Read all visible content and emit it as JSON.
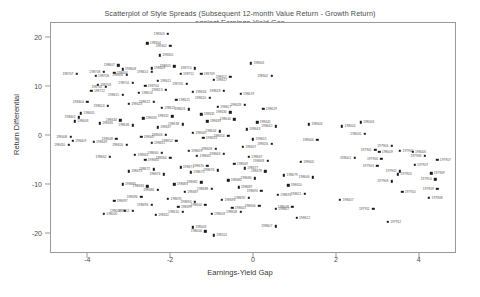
{
  "chart_data": {
    "type": "scatter",
    "title_line1": "Scatterplot of Style Spreads (Subsequent 12-month Value Return - Growth Return)",
    "title_line2": "against Earnings-Yield Gap",
    "xlabel": "Earnings-Yield Gap",
    "ylabel": "Return Differential",
    "xlim": [
      -4.9,
      4.9
    ],
    "ylim": [
      -24,
      23
    ],
    "xticks": [
      -4,
      -2,
      0,
      2,
      4
    ],
    "xtick_labels": [
      "-4",
      "-2",
      "0",
      "2",
      "4"
    ],
    "yticks": [
      20,
      10,
      0,
      -10,
      -20
    ],
    "ytick_labels": [
      "20",
      "10",
      "0",
      "-10",
      "-20"
    ],
    "grid": false,
    "legend": "none",
    "marker": "square",
    "marker_color": "#1a1a1a",
    "point_labels_shown": true,
    "points": [
      {
        "x": -2.05,
        "y": 20.6,
        "label": "198303"
      },
      {
        "x": -2.55,
        "y": 18.7,
        "label": "198304"
      },
      {
        "x": -2.0,
        "y": 18.2,
        "label": "198302"
      },
      {
        "x": -2.25,
        "y": 16.2,
        "label": "198305"
      },
      {
        "x": -3.25,
        "y": 14.2,
        "label": "198607"
      },
      {
        "x": -3.15,
        "y": 13.4,
        "label": "198608"
      },
      {
        "x": -3.6,
        "y": 12.9,
        "label": "198708"
      },
      {
        "x": -3.35,
        "y": 12.7,
        "label": "198604"
      },
      {
        "x": -3.05,
        "y": 12.3,
        "label": "198606"
      },
      {
        "x": -2.45,
        "y": 13.6,
        "label": "198609"
      },
      {
        "x": -2.45,
        "y": 12.9,
        "label": "198610"
      },
      {
        "x": -3.8,
        "y": 12.0,
        "label": "198706"
      },
      {
        "x": -1.9,
        "y": 14.0,
        "label": "198605"
      },
      {
        "x": -1.75,
        "y": 12.4,
        "label": "198711"
      },
      {
        "x": -1.4,
        "y": 13.6,
        "label": "198710"
      },
      {
        "x": -1.25,
        "y": 12.5,
        "label": "198709"
      },
      {
        "x": -0.55,
        "y": 11.8,
        "label": "198612"
      },
      {
        "x": -2.3,
        "y": 11.0,
        "label": "198611"
      },
      {
        "x": -2.9,
        "y": 10.6,
        "label": "198701"
      },
      {
        "x": -3.75,
        "y": 10.2,
        "label": "198703"
      },
      {
        "x": -3.55,
        "y": 9.8,
        "label": "198702"
      },
      {
        "x": -2.6,
        "y": 10.0,
        "label": "198704"
      },
      {
        "x": -1.6,
        "y": 10.4,
        "label": "198705"
      },
      {
        "x": -0.95,
        "y": 11.2,
        "label": "198617"
      },
      {
        "x": -2.1,
        "y": 9.2,
        "label": "198613"
      },
      {
        "x": -2.75,
        "y": 8.6,
        "label": "198614"
      },
      {
        "x": -3.15,
        "y": 8.2,
        "label": "198615"
      },
      {
        "x": -1.45,
        "y": 8.8,
        "label": "198616"
      },
      {
        "x": -0.7,
        "y": 9.0,
        "label": "198618"
      },
      {
        "x": -0.3,
        "y": 8.4,
        "label": "198619"
      },
      {
        "x": -1.05,
        "y": 7.6,
        "label": "198620"
      },
      {
        "x": -1.85,
        "y": 7.2,
        "label": "198621"
      },
      {
        "x": -2.4,
        "y": 6.8,
        "label": "198622"
      },
      {
        "x": -3.0,
        "y": 6.4,
        "label": "198623"
      },
      {
        "x": -3.5,
        "y": 6.0,
        "label": "198624"
      },
      {
        "x": -2.2,
        "y": 5.6,
        "label": "198625"
      },
      {
        "x": -1.55,
        "y": 5.2,
        "label": "198626"
      },
      {
        "x": -0.85,
        "y": 5.8,
        "label": "198627"
      },
      {
        "x": -0.2,
        "y": 6.2,
        "label": "198628"
      },
      {
        "x": 0.25,
        "y": 5.4,
        "label": "198629"
      },
      {
        "x": -0.55,
        "y": 4.6,
        "label": "198630"
      },
      {
        "x": -1.25,
        "y": 4.2,
        "label": "198631"
      },
      {
        "x": -1.95,
        "y": 3.8,
        "label": "198632"
      },
      {
        "x": -2.65,
        "y": 3.4,
        "label": "198633"
      },
      {
        "x": -3.2,
        "y": 3.0,
        "label": "198634"
      },
      {
        "x": -3.7,
        "y": 2.4,
        "label": "198635"
      },
      {
        "x": -2.9,
        "y": 2.0,
        "label": "198636"
      },
      {
        "x": -2.3,
        "y": 1.6,
        "label": "198637"
      },
      {
        "x": -1.7,
        "y": 2.2,
        "label": "198638"
      },
      {
        "x": -1.1,
        "y": 2.8,
        "label": "198639"
      },
      {
        "x": -0.45,
        "y": 3.2,
        "label": "198640"
      },
      {
        "x": 0.1,
        "y": 2.6,
        "label": "198641"
      },
      {
        "x": 0.55,
        "y": 1.8,
        "label": "198642"
      },
      {
        "x": -0.15,
        "y": 1.2,
        "label": "198643"
      },
      {
        "x": -0.8,
        "y": 0.8,
        "label": "198644"
      },
      {
        "x": -1.45,
        "y": 0.4,
        "label": "198645"
      },
      {
        "x": -2.1,
        "y": 0.0,
        "label": "198646"
      },
      {
        "x": -2.7,
        "y": -0.4,
        "label": "198647"
      },
      {
        "x": -3.3,
        "y": -0.8,
        "label": "198648"
      },
      {
        "x": -3.85,
        "y": -1.4,
        "label": "198649"
      },
      {
        "x": -3.05,
        "y": -2.0,
        "label": "198650"
      },
      {
        "x": -2.45,
        "y": -1.6,
        "label": "198651"
      },
      {
        "x": -1.85,
        "y": -1.2,
        "label": "198652"
      },
      {
        "x": -1.2,
        "y": -0.6,
        "label": "198653"
      },
      {
        "x": -0.6,
        "y": -0.2,
        "label": "198654"
      },
      {
        "x": 0.0,
        "y": -0.9,
        "label": "198655"
      },
      {
        "x": 0.45,
        "y": -1.8,
        "label": "198656"
      },
      {
        "x": -0.25,
        "y": -2.4,
        "label": "198657"
      },
      {
        "x": -0.9,
        "y": -2.8,
        "label": "198658"
      },
      {
        "x": -1.55,
        "y": -3.2,
        "label": "198659"
      },
      {
        "x": -2.2,
        "y": -3.6,
        "label": "198660"
      },
      {
        "x": -2.85,
        "y": -4.0,
        "label": "198661"
      },
      {
        "x": -3.45,
        "y": -4.4,
        "label": "198662"
      },
      {
        "x": -2.6,
        "y": -5.0,
        "label": "198663"
      },
      {
        "x": -2.0,
        "y": -4.6,
        "label": "198664"
      },
      {
        "x": -1.35,
        "y": -4.2,
        "label": "198665"
      },
      {
        "x": -0.7,
        "y": -3.8,
        "label": "198666"
      },
      {
        "x": -0.1,
        "y": -4.4,
        "label": "198667"
      },
      {
        "x": 0.35,
        "y": -5.2,
        "label": "198668"
      },
      {
        "x": -0.45,
        "y": -5.8,
        "label": "198669"
      },
      {
        "x": -1.1,
        "y": -6.2,
        "label": "198670"
      },
      {
        "x": -1.75,
        "y": -6.6,
        "label": "198671"
      },
      {
        "x": -2.4,
        "y": -7.0,
        "label": "198672"
      },
      {
        "x": -3.0,
        "y": -7.4,
        "label": "198673"
      },
      {
        "x": -2.15,
        "y": -8.0,
        "label": "198674"
      },
      {
        "x": -1.5,
        "y": -7.6,
        "label": "198675"
      },
      {
        "x": -0.85,
        "y": -7.2,
        "label": "198676"
      },
      {
        "x": -0.2,
        "y": -6.8,
        "label": "198677"
      },
      {
        "x": 0.3,
        "y": -7.4,
        "label": "198678"
      },
      {
        "x": 0.75,
        "y": -8.2,
        "label": "198679"
      },
      {
        "x": 0.05,
        "y": -8.8,
        "label": "198680"
      },
      {
        "x": -0.6,
        "y": -9.2,
        "label": "198681"
      },
      {
        "x": -1.25,
        "y": -9.6,
        "label": "198682"
      },
      {
        "x": -1.9,
        "y": -10.0,
        "label": "198683"
      },
      {
        "x": -2.55,
        "y": -10.4,
        "label": "198684"
      },
      {
        "x": -3.15,
        "y": -10.0,
        "label": "198685"
      },
      {
        "x": -2.3,
        "y": -11.2,
        "label": "198686"
      },
      {
        "x": -1.65,
        "y": -11.6,
        "label": "198687"
      },
      {
        "x": -1.0,
        "y": -11.0,
        "label": "198688"
      },
      {
        "x": -0.35,
        "y": -10.6,
        "label": "198689"
      },
      {
        "x": 0.2,
        "y": -11.4,
        "label": "198690"
      },
      {
        "x": 0.6,
        "y": -12.2,
        "label": "198691"
      },
      {
        "x": -0.1,
        "y": -12.8,
        "label": "198692"
      },
      {
        "x": -0.75,
        "y": -13.2,
        "label": "198693"
      },
      {
        "x": -1.4,
        "y": -13.6,
        "label": "198694"
      },
      {
        "x": -2.05,
        "y": -13.0,
        "label": "198695"
      },
      {
        "x": -2.7,
        "y": -12.6,
        "label": "198696"
      },
      {
        "x": -3.35,
        "y": -13.4,
        "label": "198697"
      },
      {
        "x": -2.45,
        "y": -14.2,
        "label": "198698"
      },
      {
        "x": -1.8,
        "y": -14.6,
        "label": "198699"
      },
      {
        "x": -1.15,
        "y": -14.2,
        "label": "198600"
      },
      {
        "x": -0.5,
        "y": -14.8,
        "label": "198605"
      },
      {
        "x": 0.15,
        "y": -14.4,
        "label": "198606"
      },
      {
        "x": 0.55,
        "y": -15.0,
        "label": "198607"
      },
      {
        "x": -0.3,
        "y": -15.6,
        "label": "198608"
      },
      {
        "x": -1.0,
        "y": -16.0,
        "label": "198609"
      },
      {
        "x": -1.7,
        "y": -15.6,
        "label": "198610"
      },
      {
        "x": -2.35,
        "y": -16.2,
        "label": "198611"
      },
      {
        "x": -2.9,
        "y": -15.4,
        "label": "198612"
      },
      {
        "x": -1.45,
        "y": -18.8,
        "label": "198003"
      },
      {
        "x": -1.15,
        "y": -19.6,
        "label": "198004"
      },
      {
        "x": -0.95,
        "y": -20.4,
        "label": "198101"
      },
      {
        "x": 0.55,
        "y": -18.6,
        "label": "198607"
      },
      {
        "x": 1.05,
        "y": -16.8,
        "label": "198612"
      },
      {
        "x": 0.95,
        "y": -14.6,
        "label": "198008"
      },
      {
        "x": -3.9,
        "y": 9.0,
        "label": "198712"
      },
      {
        "x": -4.25,
        "y": 12.4,
        "label": "198707"
      },
      {
        "x": -4.15,
        "y": 4.4,
        "label": "198401"
      },
      {
        "x": -4.2,
        "y": 3.6,
        "label": "198402"
      },
      {
        "x": -4.3,
        "y": 2.8,
        "label": "198403"
      },
      {
        "x": -4.0,
        "y": 6.8,
        "label": "198404"
      },
      {
        "x": -3.6,
        "y": -16.0,
        "label": "198005"
      },
      {
        "x": -3.1,
        "y": -15.4,
        "label": "198006"
      },
      {
        "x": 2.15,
        "y": 1.8,
        "label": "198002"
      },
      {
        "x": 2.45,
        "y": -4.6,
        "label": "198001"
      },
      {
        "x": 2.1,
        "y": -13.2,
        "label": "198007"
      },
      {
        "x": 2.95,
        "y": -3.0,
        "label": "197901"
      },
      {
        "x": 3.05,
        "y": -3.4,
        "label": "198009"
      },
      {
        "x": 3.35,
        "y": -2.2,
        "label": "197906"
      },
      {
        "x": 3.55,
        "y": -3.2,
        "label": "197905"
      },
      {
        "x": 3.1,
        "y": -4.8,
        "label": "197904"
      },
      {
        "x": 3.85,
        "y": -3.4,
        "label": "198006"
      },
      {
        "x": 4.15,
        "y": -4.2,
        "label": "197908"
      },
      {
        "x": 4.45,
        "y": -5.0,
        "label": "197907"
      },
      {
        "x": 3.0,
        "y": -6.2,
        "label": "197903"
      },
      {
        "x": 3.9,
        "y": -6.0,
        "label": "197907"
      },
      {
        "x": 3.55,
        "y": -7.4,
        "label": "197902"
      },
      {
        "x": 3.5,
        "y": -8.0,
        "label": "197903"
      },
      {
        "x": 3.35,
        "y": -9.4,
        "label": "197908"
      },
      {
        "x": 4.3,
        "y": -7.8,
        "label": "197909"
      },
      {
        "x": 4.4,
        "y": -9.0,
        "label": "197910"
      },
      {
        "x": 3.6,
        "y": -11.6,
        "label": "197910"
      },
      {
        "x": 4.45,
        "y": -11.0,
        "label": "197909"
      },
      {
        "x": 4.25,
        "y": -12.8,
        "label": "197908"
      },
      {
        "x": 2.9,
        "y": -15.0,
        "label": "197911"
      },
      {
        "x": 3.25,
        "y": -17.6,
        "label": "197912"
      },
      {
        "x": 2.7,
        "y": 0.2,
        "label": "198005"
      },
      {
        "x": 2.6,
        "y": 2.6,
        "label": "198003"
      },
      {
        "x": -4.4,
        "y": -0.4,
        "label": "198408"
      },
      {
        "x": -4.35,
        "y": -1.2,
        "label": "198409"
      },
      {
        "x": -4.45,
        "y": -2.0,
        "label": "198410"
      },
      {
        "x": -0.05,
        "y": 14.6,
        "label": "198601"
      },
      {
        "x": 0.45,
        "y": 12.0,
        "label": "198602"
      },
      {
        "x": 1.35,
        "y": 2.2,
        "label": "198603"
      },
      {
        "x": 1.55,
        "y": -1.0,
        "label": "198604"
      },
      {
        "x": 1.15,
        "y": -5.4,
        "label": "198605"
      },
      {
        "x": 1.45,
        "y": -8.6,
        "label": "198606"
      },
      {
        "x": 0.85,
        "y": -10.2,
        "label": "198610"
      },
      {
        "x": 1.25,
        "y": -12.0,
        "label": "198611"
      }
    ]
  }
}
